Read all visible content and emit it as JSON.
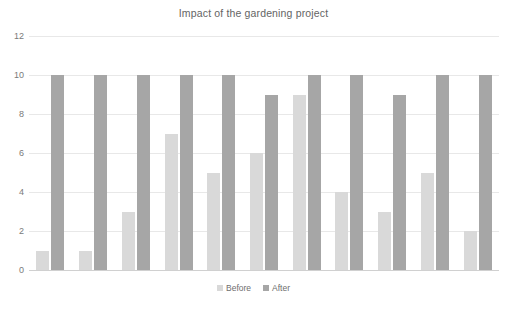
{
  "chart_data": {
    "type": "bar",
    "title": "Impact of the gardening project",
    "xlabel": "",
    "ylabel": "",
    "ylim": [
      0,
      12
    ],
    "yticks": [
      0,
      2,
      4,
      6,
      8,
      10,
      12
    ],
    "ytick_labels": [
      "0",
      "2",
      "4",
      "6",
      "8",
      "10",
      "12"
    ],
    "grid": true,
    "xticks_visible": false,
    "categories": [
      "1",
      "2",
      "3",
      "4",
      "5",
      "6",
      "7",
      "8",
      "9",
      "10",
      "11"
    ],
    "series": [
      {
        "name": "Before",
        "color": "#d9d9d9",
        "values": [
          1,
          1,
          3,
          7,
          5,
          6,
          9,
          4,
          3,
          5,
          2
        ]
      },
      {
        "name": "After",
        "color": "#a6a6a6",
        "values": [
          10,
          10,
          10,
          10,
          10,
          9,
          10,
          10,
          9,
          10,
          10
        ]
      }
    ],
    "legend": {
      "position": "bottom",
      "entries": [
        "Before",
        "After"
      ]
    },
    "colors": {
      "before": "#d9d9d9",
      "after": "#a6a6a6",
      "gridline": "#e8e8e8",
      "text": "#7a7a7a",
      "title": "#646464",
      "background": "#ffffff"
    }
  }
}
